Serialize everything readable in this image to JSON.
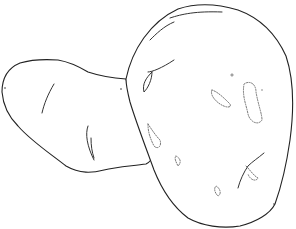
{
  "scene": {
    "subject": "Line drawing of two potatoes",
    "background_color": "#ffffff",
    "stroke_color": "#222222",
    "objects": [
      {
        "name": "small-elongated-potato",
        "position": "left, behind"
      },
      {
        "name": "large-oval-potato",
        "position": "right, front"
      }
    ]
  }
}
